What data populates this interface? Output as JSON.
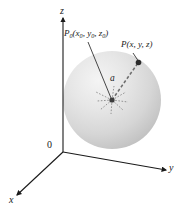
{
  "figure": {
    "background_color": "#ffffff",
    "ink_color": "#1a1a1a",
    "sphere": {
      "fill_light": "#f2f2f2",
      "fill_mid": "#d8d8d8",
      "fill_dark": "#b9b9b9",
      "center_x": 112,
      "center_y": 100,
      "radius": 49
    },
    "axes": {
      "z": {
        "label": "z",
        "arrow": "up"
      },
      "y": {
        "label": "y",
        "arrow": "right"
      },
      "x": {
        "label": "x",
        "arrow": "down-left"
      },
      "origin_label": "0"
    },
    "points": [
      {
        "name": "center-point",
        "label_prefix": "P",
        "label_subscript": "0",
        "label_coords": "(x₀, y₀, z₀)",
        "text_main": "P",
        "text_sub": "0",
        "text_args": "(x",
        "x": 112,
        "y": 100
      },
      {
        "name": "surface-point",
        "label_prefix": "P",
        "label_coords": "(x, y, z)",
        "x": 138,
        "y": 63
      }
    ],
    "radius_label": "a",
    "labels": {
      "z_axis": "z",
      "y_axis": "y",
      "x_axis": "x",
      "origin": "0",
      "p0_P": "P",
      "p0_sub": "0",
      "p0_rest": "(x",
      "p0_sub1": "0",
      "p0_rest2": ", y",
      "p0_sub2": "0",
      "p0_rest3": ", z",
      "p0_sub3": "0",
      "p0_rest4": ")",
      "p_full": "P(x, y, z)",
      "radius": "a"
    }
  }
}
